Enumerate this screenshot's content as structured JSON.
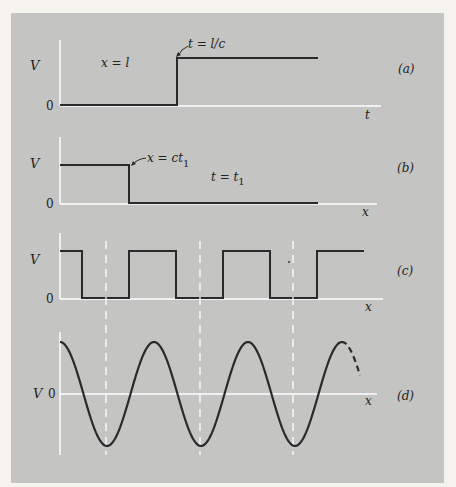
{
  "figure": {
    "panels": [
      {
        "id": "a",
        "tag": "(a)",
        "y_label": "V",
        "zero_label": "0",
        "x_axis_label": "t",
        "annotation_left": "x = l",
        "annotation_step": "t = l/c",
        "description": "Step function in time at position x = l; voltage rises from 0 to V at t = l/c"
      },
      {
        "id": "b",
        "tag": "(b)",
        "y_label": "V",
        "zero_label": "0",
        "x_axis_label": "x",
        "annotation_step": "x = ct",
        "annotation_step_sub": "1",
        "annotation_right": "t = t",
        "annotation_right_sub": "1",
        "description": "Voltage vs position at time t = t1; V up to x = ct1, then 0"
      },
      {
        "id": "c",
        "tag": "(c)",
        "y_label": "V",
        "zero_label": "0",
        "x_axis_label": "x",
        "description": "Square wave of voltage vs position"
      },
      {
        "id": "d",
        "tag": "(d)",
        "y_label": "V",
        "zero_label": "0",
        "x_axis_label": "x",
        "description": "Sinusoidal voltage vs position, continuing dashed at the end"
      }
    ]
  },
  "colors": {
    "panel_bg": "#c4c4c2",
    "page_bg": "#f4f3ee",
    "trace": "#2a2a2a",
    "axis": "#ffffff"
  }
}
